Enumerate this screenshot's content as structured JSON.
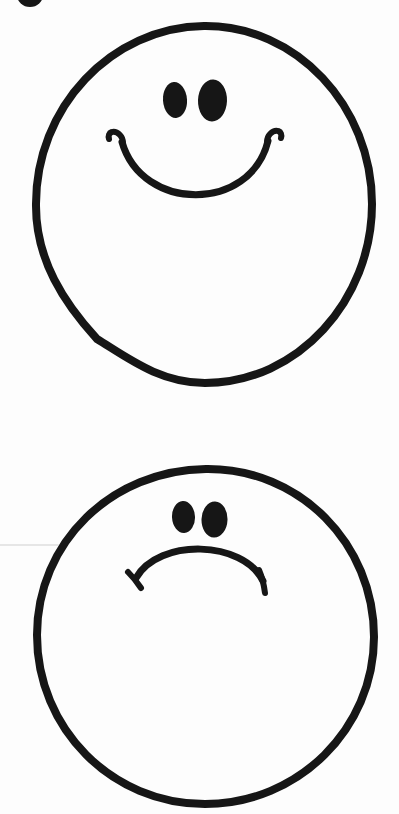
{
  "page": {
    "background_color": "#fdfdfd",
    "ink_color": "#161616",
    "artifact_line_color": "#dedede"
  },
  "figures": {
    "corner_dot": {
      "label": "partial black dot cropped at top-left corner"
    },
    "happy_face": {
      "label": "happy face",
      "expression": "smiling",
      "eyes": "two solid black ovals",
      "mouth": "wide upturned smile arc with small flicked hooks at both ends"
    },
    "sad_face": {
      "label": "sad face",
      "expression": "frowning",
      "eyes": "two solid black ovals",
      "mouth": "downturned frown arc with short tick marks crossing both ends"
    },
    "scan_artifact": {
      "label": "faint horizontal scan line left of the sad face"
    }
  }
}
